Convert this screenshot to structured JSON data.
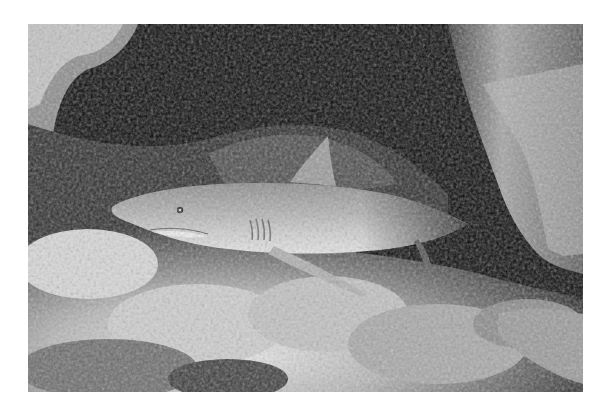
{
  "image": {
    "subject": "Grey reef shark resting under a coral overhang",
    "style": "black-and-white photograph",
    "colors": {
      "page_background": "#ffffff",
      "cave_shadow": "#0a0a0a",
      "coral_highlight": "#e6e6e6",
      "coral_mid": "#9a9a9a",
      "shark_body": "#a8a8a8",
      "shark_belly": "#e2e2e2"
    }
  }
}
